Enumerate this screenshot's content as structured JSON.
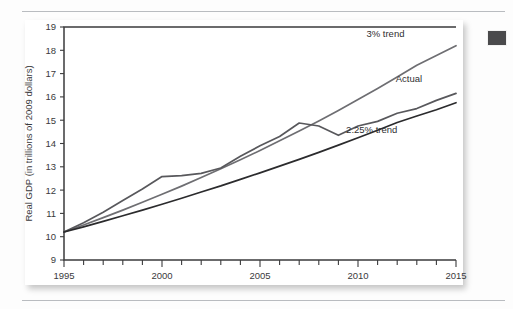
{
  "page": {
    "background_color": "#fdfdfd",
    "rule_color": "#b9bcc0",
    "edge_mark_color": "#4a4a4c"
  },
  "chart_data": {
    "type": "line",
    "title": "",
    "xlabel": "Years",
    "ylabel": "Real GDP (in trillions of 2009 dollars)",
    "xlim": [
      1995,
      2015
    ],
    "ylim": [
      9,
      19
    ],
    "ytick_labels": [
      "9",
      "10",
      "11",
      "12",
      "13",
      "14",
      "15",
      "16",
      "17",
      "18",
      "19"
    ],
    "yticks": [
      9,
      10,
      11,
      12,
      13,
      14,
      15,
      16,
      17,
      18,
      19
    ],
    "xtick_labels": [
      "1995",
      "2000",
      "2005",
      "2010",
      "2015"
    ],
    "xticks": [
      1995,
      2000,
      2005,
      2010,
      2015
    ],
    "minor_xticks_every": 1,
    "grid": false,
    "legend_position": "inline-end-labels",
    "x": [
      1995,
      1996,
      1997,
      1998,
      1999,
      2000,
      2001,
      2002,
      2003,
      2004,
      2005,
      2006,
      2007,
      2008,
      2009,
      2010,
      2011,
      2012,
      2013,
      2014,
      2015
    ],
    "series": [
      {
        "name": "3% trend",
        "label": "3% trend",
        "color": "#6e6e72",
        "width": 1.7,
        "values": [
          10.2,
          10.5,
          10.82,
          11.14,
          11.48,
          11.82,
          12.17,
          12.54,
          12.92,
          13.3,
          13.7,
          14.12,
          14.54,
          14.97,
          15.42,
          15.89,
          16.36,
          16.85,
          17.36,
          17.78,
          18.2
        ]
      },
      {
        "name": "Actual",
        "label": "Actual",
        "color": "#58585c",
        "width": 1.7,
        "values": [
          10.2,
          10.6,
          11.05,
          11.55,
          12.05,
          12.58,
          12.62,
          12.72,
          12.95,
          13.45,
          13.9,
          14.3,
          14.88,
          14.75,
          14.35,
          14.75,
          14.95,
          15.3,
          15.5,
          15.85,
          16.15
        ]
      },
      {
        "name": "2.25% trend",
        "label": "2.25% trend",
        "color": "#2b2b2d",
        "width": 1.7,
        "values": [
          10.2,
          10.42,
          10.66,
          10.9,
          11.14,
          11.39,
          11.65,
          11.92,
          12.18,
          12.46,
          12.74,
          13.03,
          13.32,
          13.62,
          13.93,
          14.25,
          14.57,
          14.9,
          15.18,
          15.45,
          15.75
        ]
      }
    ],
    "annotations": [
      {
        "text": "3% trend",
        "x": 2011.4,
        "y": 18.55
      },
      {
        "text": "Actual",
        "x": 2012.6,
        "y": 16.62
      },
      {
        "text": "2.25% trend",
        "x": 2010.7,
        "y": 14.45
      }
    ]
  }
}
